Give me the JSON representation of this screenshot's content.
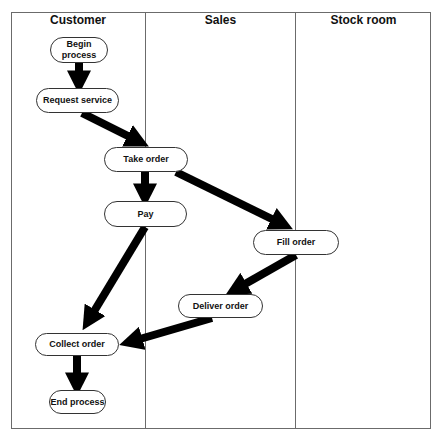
{
  "diagram": {
    "type": "swimlane-flowchart",
    "lanes": [
      {
        "id": "customer",
        "title": "Customer"
      },
      {
        "id": "sales",
        "title": "Sales"
      },
      {
        "id": "stock",
        "title": "Stock room"
      }
    ],
    "nodes": [
      {
        "id": "begin",
        "label": "Begin\nprocess",
        "lane": "customer"
      },
      {
        "id": "request",
        "label": "Request service",
        "lane": "customer"
      },
      {
        "id": "take",
        "label": "Take order",
        "lane": "sales"
      },
      {
        "id": "pay",
        "label": "Pay",
        "lane": "customer"
      },
      {
        "id": "fill",
        "label": "Fill order",
        "lane": "stock"
      },
      {
        "id": "deliver",
        "label": "Deliver order",
        "lane": "sales"
      },
      {
        "id": "collect",
        "label": "Collect order",
        "lane": "customer"
      },
      {
        "id": "end",
        "label": "End process",
        "lane": "customer"
      }
    ],
    "edges": [
      {
        "from": "begin",
        "to": "request"
      },
      {
        "from": "request",
        "to": "take"
      },
      {
        "from": "take",
        "to": "pay"
      },
      {
        "from": "take",
        "to": "fill"
      },
      {
        "from": "pay",
        "to": "collect"
      },
      {
        "from": "fill",
        "to": "deliver"
      },
      {
        "from": "deliver",
        "to": "collect"
      },
      {
        "from": "collect",
        "to": "end"
      }
    ],
    "colors": {
      "line": "#6b6b6b",
      "arrow": "#000000",
      "node_border": "#333333"
    }
  }
}
